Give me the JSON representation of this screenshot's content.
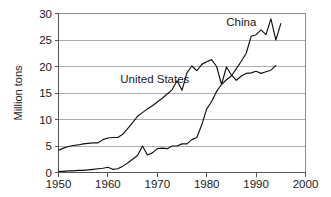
{
  "chart_data": {
    "type": "line",
    "title": "",
    "xlabel": "",
    "ylabel": "Million tons",
    "xlim": [
      1950,
      2000
    ],
    "ylim": [
      0,
      30
    ],
    "xticks": [
      1950,
      1960,
      1970,
      1980,
      1990,
      2000
    ],
    "yticks": [
      0,
      5,
      10,
      15,
      20,
      25,
      30
    ],
    "grid": true,
    "grid_axis": "y",
    "legend": "inline-labels",
    "annotations": [
      {
        "text": "China",
        "x": 1987.0,
        "y": 27.6
      },
      {
        "text": "United States",
        "x": 1969.5,
        "y": 16.8
      }
    ],
    "series": [
      {
        "name": "United States",
        "label": "United States",
        "color": "#111111",
        "x": [
          1950,
          1951,
          1952,
          1953,
          1954,
          1955,
          1956,
          1957,
          1958,
          1959,
          1960,
          1961,
          1962,
          1963,
          1964,
          1965,
          1966,
          1967,
          1968,
          1969,
          1970,
          1971,
          1972,
          1973,
          1974,
          1975,
          1976,
          1977,
          1978,
          1979,
          1980,
          1981,
          1982,
          1983,
          1984,
          1985,
          1986,
          1987,
          1988,
          1989,
          1990,
          1991,
          1992,
          1993,
          1994
        ],
        "y": [
          4.2,
          4.6,
          4.9,
          5.1,
          5.2,
          5.4,
          5.5,
          5.6,
          5.6,
          6.2,
          6.5,
          6.6,
          6.6,
          7.2,
          8.3,
          9.4,
          10.6,
          11.3,
          12.0,
          12.6,
          13.3,
          14.0,
          14.8,
          15.6,
          17.3,
          15.5,
          18.8,
          20.1,
          19.2,
          20.4,
          20.9,
          21.3,
          20.0,
          16.6,
          19.9,
          18.4,
          17.4,
          18.2,
          18.7,
          18.8,
          19.1,
          18.7,
          19.0,
          19.3,
          20.2
        ]
      },
      {
        "name": "China",
        "label": "China",
        "color": "#111111",
        "x": [
          1950,
          1951,
          1952,
          1953,
          1954,
          1955,
          1956,
          1957,
          1958,
          1959,
          1960,
          1961,
          1962,
          1963,
          1964,
          1965,
          1966,
          1967,
          1968,
          1969,
          1970,
          1971,
          1972,
          1973,
          1974,
          1975,
          1976,
          1977,
          1978,
          1979,
          1980,
          1981,
          1982,
          1983,
          1984,
          1985,
          1986,
          1987,
          1988,
          1989,
          1990,
          1991,
          1992,
          1993,
          1994,
          1995
        ],
        "y": [
          0.2,
          0.2,
          0.3,
          0.3,
          0.4,
          0.4,
          0.5,
          0.6,
          0.7,
          0.8,
          1.0,
          0.6,
          0.7,
          1.2,
          1.8,
          2.5,
          3.2,
          5.0,
          3.3,
          3.7,
          4.5,
          4.6,
          4.5,
          5.0,
          5.0,
          5.4,
          5.4,
          6.2,
          6.6,
          9.0,
          12.0,
          13.4,
          15.3,
          16.6,
          17.5,
          18.2,
          19.6,
          21.0,
          22.5,
          25.7,
          26.0,
          26.9,
          26.0,
          29.0,
          25.0,
          28.1
        ]
      }
    ]
  }
}
